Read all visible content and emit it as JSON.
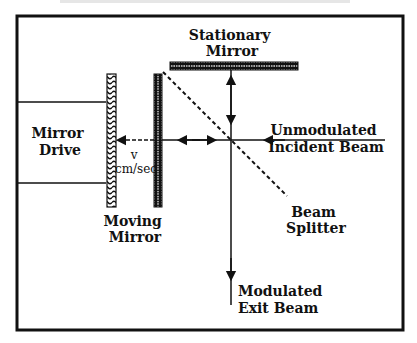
{
  "figure": {
    "type": "Michelson interferometer schematic",
    "labels": {
      "stationary_mirror": [
        "Stationary",
        "Mirror"
      ],
      "mirror_drive": [
        "Mirror",
        "Drive"
      ],
      "velocity": [
        "v",
        "cm/sec"
      ],
      "moving_mirror": [
        "Moving",
        "Mirror"
      ],
      "incident_beam": [
        "Unmodulated",
        "Incident Beam"
      ],
      "beam_splitter": [
        "Beam",
        "Splitter"
      ],
      "exit_beam": [
        "Modulated",
        "Exit Beam"
      ]
    },
    "colors": {
      "ink": "#111111",
      "background": "#ffffff"
    }
  }
}
